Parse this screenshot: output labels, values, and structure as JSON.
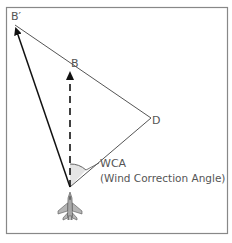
{
  "diagram": {
    "labels": {
      "b_prime": "B′",
      "b": "B",
      "d": "D",
      "wca_short": "WCA",
      "wca_full": "(Wind Correction Angle)"
    },
    "points": {
      "origin": [
        70,
        187
      ],
      "b_prime": [
        14,
        24
      ],
      "b": [
        71,
        70
      ],
      "d": [
        151,
        118
      ]
    },
    "colors": {
      "line": "#222222",
      "thin_line": "#555555",
      "border": "#777777",
      "angle_fill": "#e2e2e2",
      "text": "#555555",
      "aircraft": "#9a9a9a"
    },
    "icons": {
      "aircraft": "fighter-jet-top-view-icon"
    }
  }
}
